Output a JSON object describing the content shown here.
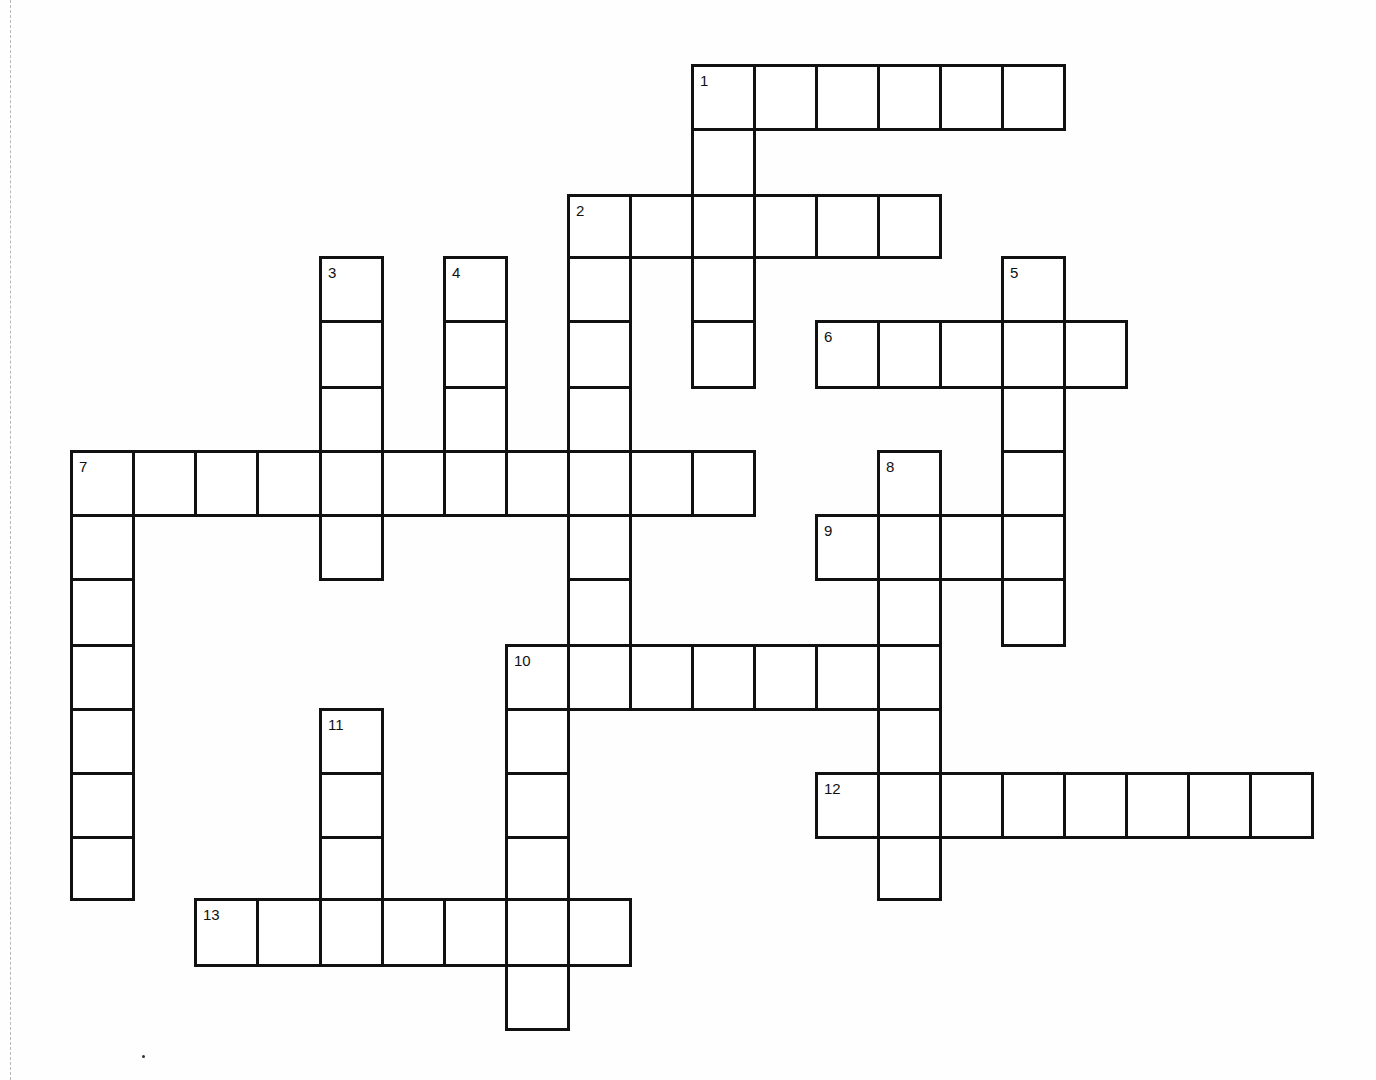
{
  "puzzle": {
    "type": "crossword",
    "grid": {
      "col_x": [
        71,
        133,
        195,
        257,
        320,
        382,
        444,
        506,
        568,
        630,
        692,
        754,
        816,
        878,
        940,
        1002,
        1064,
        1126,
        1188,
        1250,
        1312
      ],
      "row_y": [
        65,
        129,
        195,
        257,
        321,
        387,
        451,
        515,
        579,
        645,
        709,
        773,
        837,
        899,
        965,
        1029
      ]
    },
    "entries": [
      {
        "number": "1",
        "direction": "across",
        "row": 0,
        "col": 10,
        "length": 6
      },
      {
        "number": "1",
        "direction": "down",
        "row": 0,
        "col": 10,
        "length": 5
      },
      {
        "number": "2",
        "direction": "across",
        "row": 2,
        "col": 8,
        "length": 6
      },
      {
        "number": "2",
        "direction": "down",
        "row": 2,
        "col": 8,
        "length": 8
      },
      {
        "number": "3",
        "direction": "down",
        "row": 3,
        "col": 4,
        "length": 5
      },
      {
        "number": "4",
        "direction": "down",
        "row": 3,
        "col": 6,
        "length": 4
      },
      {
        "number": "5",
        "direction": "down",
        "row": 3,
        "col": 15,
        "length": 6
      },
      {
        "number": "6",
        "direction": "across",
        "row": 4,
        "col": 12,
        "length": 5
      },
      {
        "number": "7",
        "direction": "across",
        "row": 6,
        "col": 0,
        "length": 11
      },
      {
        "number": "7",
        "direction": "down",
        "row": 6,
        "col": 0,
        "length": 7
      },
      {
        "number": "8",
        "direction": "down",
        "row": 6,
        "col": 13,
        "length": 7
      },
      {
        "number": "9",
        "direction": "across",
        "row": 7,
        "col": 12,
        "length": 4
      },
      {
        "number": "10",
        "direction": "across",
        "row": 9,
        "col": 7,
        "length": 7
      },
      {
        "number": "10",
        "direction": "down",
        "row": 9,
        "col": 7,
        "length": 6
      },
      {
        "number": "11",
        "direction": "down",
        "row": 10,
        "col": 4,
        "length": 4
      },
      {
        "number": "12",
        "direction": "across",
        "row": 11,
        "col": 12,
        "length": 8
      },
      {
        "number": "13",
        "direction": "across",
        "row": 13,
        "col": 2,
        "length": 7
      }
    ],
    "colors": {
      "line": "#111111",
      "background": "#fefefe",
      "cell": "#ffffff"
    }
  }
}
